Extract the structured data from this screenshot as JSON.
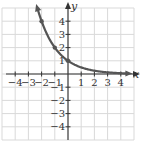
{
  "chart_data": {
    "type": "line",
    "title": "",
    "xlabel": "x",
    "ylabel": "y",
    "xlim": [
      -5,
      5
    ],
    "ylim": [
      -5,
      5
    ],
    "grid": true,
    "x_ticks": [
      -4,
      -3,
      -2,
      -1,
      1,
      2,
      3,
      4
    ],
    "y_ticks": [
      -4,
      -3,
      -2,
      -1,
      1,
      2,
      3,
      4
    ],
    "x_tick_labels": [
      "−4",
      "−3",
      "−2",
      "−1",
      "1",
      "2",
      "3",
      "4"
    ],
    "y_tick_labels": [
      "−4",
      "−3",
      "−2",
      "−1",
      "1",
      "2",
      "3",
      "4"
    ],
    "series": [
      {
        "name": "exponential decay curve",
        "function": "y = (1/2)^x",
        "x": [
          -2.3,
          -2,
          -1,
          0,
          1,
          2,
          3,
          4.5
        ],
        "y": [
          4.92,
          4,
          2,
          1,
          0.5,
          0.25,
          0.125,
          0.044
        ],
        "marked_points": [
          [
            -2,
            4
          ],
          [
            -1,
            2
          ],
          [
            0,
            1
          ]
        ],
        "color": "#555555",
        "arrows": "both ends"
      }
    ]
  },
  "colors": {
    "grid": "#d9d9d9",
    "axis": "#333333",
    "curve": "#555555"
  }
}
